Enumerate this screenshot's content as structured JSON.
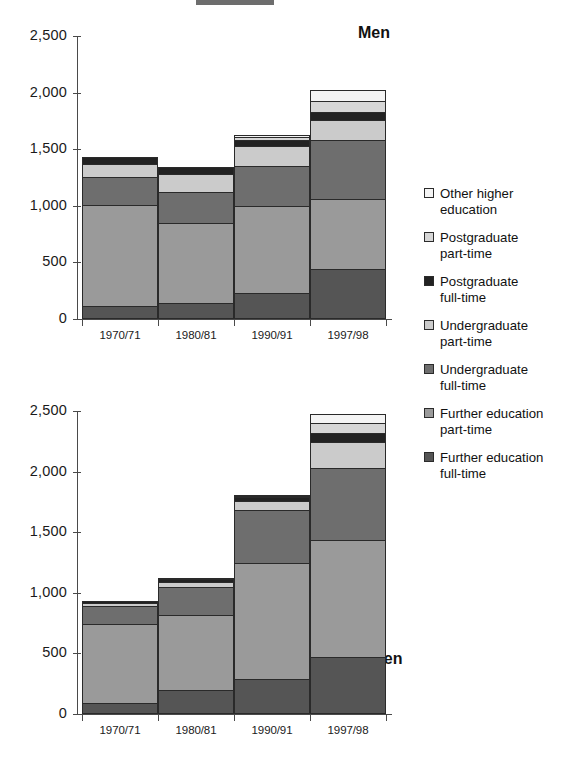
{
  "chart_data": {
    "type": "bar",
    "stacked": true,
    "title": "",
    "xlabel": "",
    "ylabel": "",
    "categories": [
      "1970/71",
      "1980/81",
      "1990/91",
      "1997/98"
    ],
    "ylim": [
      0,
      2500
    ],
    "yticks": [
      0,
      500,
      1000,
      1500,
      2000,
      2500
    ],
    "ytick_labels": [
      "0",
      "500",
      "1,000",
      "1,500",
      "2,000",
      "2,500"
    ],
    "grid": false,
    "legend_position": "right",
    "series_order_bottom_to_top": [
      "Further education full-time",
      "Further education part-time",
      "Undergraduate full-time",
      "Undergraduate part-time",
      "Postgraduate full-time",
      "Postgraduate part-time",
      "Other higher education"
    ],
    "panels": [
      {
        "name": "Men",
        "series": [
          {
            "name": "Further education full-time",
            "values": [
              116,
              143,
              232,
              438
            ]
          },
          {
            "name": "Further education part-time",
            "values": [
              893,
              705,
              768,
              625
            ]
          },
          {
            "name": "Undergraduate full-time",
            "values": [
              241,
              277,
              348,
              518
            ]
          },
          {
            "name": "Undergraduate part-time",
            "values": [
              116,
              152,
              179,
              179
            ]
          },
          {
            "name": "Postgraduate full-time",
            "values": [
              62,
              62,
              54,
              71
            ]
          },
          {
            "name": "Postgraduate part-time",
            "values": [
              0,
              0,
              25,
              98
            ]
          },
          {
            "name": "Other higher education",
            "values": [
              0,
              0,
              18,
              96
            ]
          }
        ],
        "totals": [
          1428,
          1339,
          1624,
          2025
        ]
      },
      {
        "name": "Women",
        "series": [
          {
            "name": "Further education full-time",
            "values": [
              92,
              200,
              290,
              470
            ]
          },
          {
            "name": "Further education part-time",
            "values": [
              648,
              615,
              955,
              965
            ]
          },
          {
            "name": "Undergraduate full-time",
            "values": [
              152,
              235,
              440,
              595
            ]
          },
          {
            "name": "Undergraduate part-time",
            "values": [
              25,
              42,
              70,
              217
            ]
          },
          {
            "name": "Postgraduate full-time",
            "values": [
              12,
              25,
              33,
              71
            ]
          },
          {
            "name": "Postgraduate part-time",
            "values": [
              0,
              8,
              8,
              79
            ]
          },
          {
            "name": "Other higher education",
            "values": [
              0,
              0,
              8,
              75
            ]
          }
        ],
        "totals": [
          929,
          1125,
          1804,
          2472
        ]
      }
    ],
    "colors": {
      "Further education full-time": "#555555",
      "Further education part-time": "#9a9a9a",
      "Undergraduate full-time": "#6e6e6e",
      "Undergraduate part-time": "#cbcbcb",
      "Postgraduate full-time": "#222222",
      "Postgraduate part-time": "#d6d6d6",
      "Other higher education": "#f4f4f4"
    }
  },
  "legend": {
    "items": [
      {
        "label_line1": "Other higher",
        "label_line2": "education",
        "swatch": "#f4f4f4",
        "name": "other-higher-education"
      },
      {
        "label_line1": "Postgraduate",
        "label_line2": "part-time",
        "swatch": "#d6d6d6",
        "name": "postgraduate-part-time"
      },
      {
        "label_line1": "Postgraduate",
        "label_line2": "full-time",
        "swatch": "#222222",
        "name": "postgraduate-full-time"
      },
      {
        "label_line1": "Undergraduate",
        "label_line2": "part-time",
        "swatch": "#cbcbcb",
        "name": "undergraduate-part-time"
      },
      {
        "label_line1": "Undergraduate",
        "label_line2": "full-time",
        "swatch": "#6e6e6e",
        "name": "undergraduate-full-time"
      },
      {
        "label_line1": "Further education",
        "label_line2": "part-time",
        "swatch": "#9a9a9a",
        "name": "further-education-part-time"
      },
      {
        "label_line1": "Further education",
        "label_line2": "full-time",
        "swatch": "#555555",
        "name": "further-education-full-time"
      }
    ]
  },
  "panels_meta": {
    "men": {
      "title": "Men"
    },
    "women": {
      "title": "Women"
    }
  }
}
